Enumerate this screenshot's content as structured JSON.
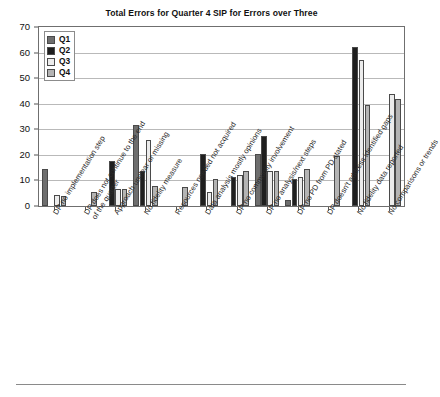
{
  "chart_data": {
    "type": "bar",
    "title": "Total Errors for Quarter 4 SIP for Errors over Three",
    "xlabel": "",
    "ylabel": "",
    "ylim": [
      0,
      70
    ],
    "yticks": [
      0,
      10,
      20,
      30,
      40,
      50,
      60,
      70
    ],
    "grid": true,
    "legend_position": "top-left",
    "categories": [
      "DP no implementation step",
      "DP does not continue to the end\nof the quarter",
      "Approach unclear or missing",
      "No fidelity measure",
      "Resources needed not acquired",
      "Data analysis mostly opinions",
      "DP no community involvement",
      "DP no analysis/next steps",
      "DP no PD from PD stated",
      "DP doesn't address identified gaps",
      "No fidelity data reported",
      "No comparisons or trends"
    ],
    "series": [
      {
        "name": "Q1",
        "color": "#6e6e6e",
        "values": [
          14.5,
          0,
          0,
          31.5,
          0,
          0,
          0,
          20.5,
          2.5,
          0,
          0,
          0
        ]
      },
      {
        "name": "Q2",
        "color": "#1f1f1f",
        "values": [
          0,
          0,
          17.5,
          13.5,
          0,
          20.5,
          11.5,
          27.5,
          10.5,
          0,
          62,
          0
        ]
      },
      {
        "name": "Q3",
        "color": "#ececec",
        "values": [
          4.5,
          0,
          6.5,
          26,
          0,
          5.5,
          12,
          13.5,
          11.5,
          0,
          57,
          44
        ]
      },
      {
        "name": "Q4",
        "color": "#b4b4b4",
        "values": [
          4,
          5.5,
          6.5,
          8,
          7.5,
          10.5,
          13.5,
          13.5,
          14.5,
          19.5,
          39.5,
          42
        ]
      }
    ]
  },
  "legend": {
    "items": [
      {
        "label": "Q1",
        "color": "#6e6e6e"
      },
      {
        "label": "Q2",
        "color": "#1f1f1f"
      },
      {
        "label": "Q3",
        "color": "#ececec"
      },
      {
        "label": "Q4",
        "color": "#b4b4b4"
      }
    ]
  }
}
